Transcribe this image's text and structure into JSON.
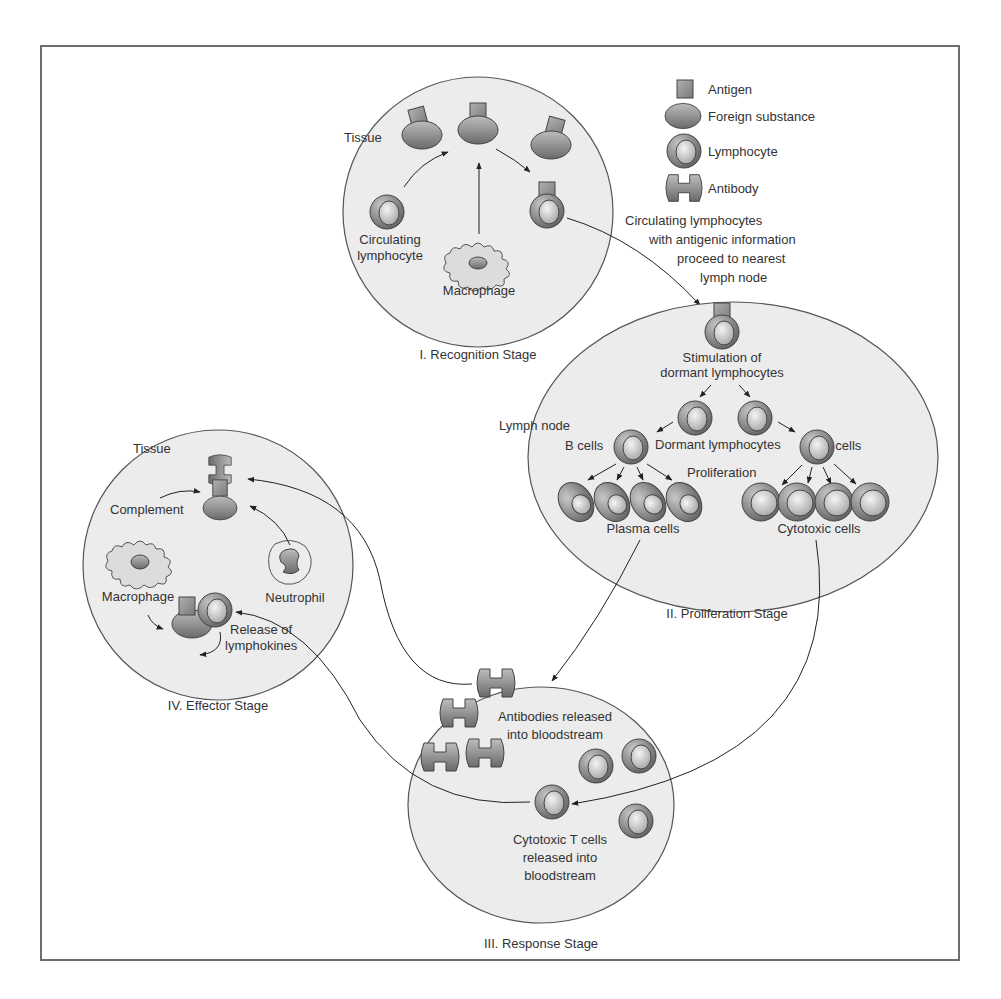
{
  "legend": {
    "items": [
      {
        "icon": "antigen-icon",
        "label": "Antigen"
      },
      {
        "icon": "foreign-substance-icon",
        "label": "Foreign substance"
      },
      {
        "icon": "lymphocyte-icon",
        "label": "Lymphocyte"
      },
      {
        "icon": "antibody-icon",
        "label": "Antibody"
      }
    ]
  },
  "stage1": {
    "title": "I. Recognition Stage",
    "tissue": "Tissue",
    "circulating_1": "Circulating",
    "circulating_2": "lymphocyte",
    "macrophage": "Macrophage"
  },
  "transit_note": {
    "line1": "Circulating lymphocytes",
    "line2": "with antigenic information",
    "line3": "proceed to nearest",
    "line4": "lymph node"
  },
  "stage2": {
    "title": "II. Proliferation Stage",
    "stim_1": "Stimulation of",
    "stim_2": "dormant lymphocytes",
    "lymph_node": "Lymph node",
    "b_cells": "B cells",
    "dormant": "Dormant lymphocytes",
    "t_cells": "T cells",
    "proliferation": "Proliferation",
    "plasma": "Plasma cells",
    "cytotoxic": "Cytotoxic cells"
  },
  "stage3": {
    "title": "III. Response Stage",
    "antibodies_1": "Antibodies released",
    "antibodies_2": "into bloodstream",
    "tcells_1": "Cytotoxic T cells",
    "tcells_2": "released into",
    "tcells_3": "bloodstream"
  },
  "stage4": {
    "title": "IV. Effector Stage",
    "tissue": "Tissue",
    "complement": "Complement",
    "macrophage": "Macrophage",
    "neutrophil": "Neutrophil",
    "release_1": "Release of",
    "release_2": "lymphokines"
  },
  "colors": {
    "frame": "#6e6e6e",
    "circle_fill": "#ececec",
    "cell_dark": "#6a6a6a",
    "cell_light": "#d8d8d8",
    "line": "#333333"
  }
}
